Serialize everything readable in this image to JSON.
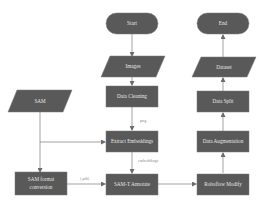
{
  "diagram": {
    "type": "flowchart",
    "colors": {
      "node": "#595959",
      "node_text": "#e6e6e6",
      "edge": "#7d7d7d",
      "background": "#ffffff"
    },
    "nodes": {
      "start": {
        "label": "Start",
        "shape": "terminator"
      },
      "images": {
        "label": "Images",
        "shape": "data"
      },
      "data_cleaning": {
        "label": "Data Cleaning",
        "shape": "process"
      },
      "extract_embeddings": {
        "label": "Extract Embeddings",
        "shape": "process"
      },
      "samt_annotate": {
        "label": "SAM-T Annotate",
        "shape": "process"
      },
      "sam": {
        "label": "SAM",
        "shape": "data"
      },
      "sam_format_line1": {
        "label": "SAM format"
      },
      "sam_format_line2": {
        "label": "conversion"
      },
      "roboflow_modify": {
        "label": "Roboflow Modify",
        "shape": "process"
      },
      "data_augmentation": {
        "label": "Data Augmentation",
        "shape": "process"
      },
      "data_split": {
        "label": "Data Split",
        "shape": "process"
      },
      "dataset": {
        "label": "Dataset",
        "shape": "data"
      },
      "end": {
        "label": "End",
        "shape": "terminator"
      }
    },
    "edges": [
      {
        "from": "start",
        "to": "images",
        "label": ""
      },
      {
        "from": "images",
        "to": "data_cleaning",
        "label": ""
      },
      {
        "from": "data_cleaning",
        "to": "extract_embeddings",
        "label": "png"
      },
      {
        "from": "extract_embeddings",
        "to": "samt_annotate",
        "label": "embeddings"
      },
      {
        "from": "sam",
        "to": "extract_embeddings",
        "label": ""
      },
      {
        "from": "sam",
        "to": "sam_format_conversion",
        "label": ""
      },
      {
        "from": "sam_format_conversion",
        "to": "samt_annotate",
        "label": "(.pth)"
      },
      {
        "from": "samt_annotate",
        "to": "roboflow_modify",
        "label": ""
      },
      {
        "from": "roboflow_modify",
        "to": "data_augmentation",
        "label": ""
      },
      {
        "from": "data_augmentation",
        "to": "data_split",
        "label": ""
      },
      {
        "from": "data_split",
        "to": "dataset",
        "label": ""
      },
      {
        "from": "dataset",
        "to": "end",
        "label": ""
      }
    ],
    "edge_labels": {
      "png": "png",
      "embeddings": "embeddings",
      "pth": "(.pth)"
    }
  }
}
